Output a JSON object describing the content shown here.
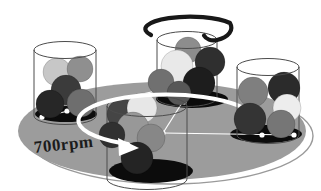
{
  "diagram": {
    "background": "#ffffff"
  },
  "label": {
    "text": "700rpm"
  },
  "colors": {
    "disc": "#9c9c9c",
    "disc_edge_line": "#9a9a9a",
    "shadow": "#0c0c0c",
    "jar_outline": "#4c4c4c",
    "linkage": "#ffffff",
    "arrow": "#ffffff",
    "spiral": "#181818",
    "label_text": "#1c1c1c"
  },
  "disc": {
    "cx": 162,
    "cy": 131,
    "rx": 144,
    "ry": 49,
    "edge": {
      "cx": 170,
      "cy": 136,
      "rx": 143,
      "ry": 48
    }
  },
  "jars": [
    {
      "name": "jar-left",
      "x1": 34,
      "x2": 96,
      "top_y": 50,
      "bottom_y": 116,
      "top_ry": 8.5,
      "shadow": {
        "cx": 66,
        "cy": 114,
        "rx": 31,
        "ry": 8
      },
      "balls": [
        {
          "cx": 57,
          "cy": 72,
          "r": 14,
          "fill": "#c7c7c7"
        },
        {
          "cx": 80,
          "cy": 69,
          "r": 13,
          "fill": "#8f8f8f"
        },
        {
          "cx": 66,
          "cy": 90,
          "r": 15,
          "fill": "#3b3b3b"
        },
        {
          "cx": 50,
          "cy": 104,
          "r": 14,
          "fill": "#272727"
        },
        {
          "cx": 81,
          "cy": 103,
          "r": 14,
          "fill": "#6e6e6e"
        }
      ]
    },
    {
      "name": "jar-top",
      "x1": 157,
      "x2": 217,
      "top_y": 40,
      "bottom_y": 98,
      "top_ry": 8.5,
      "shadow": {
        "cx": 192,
        "cy": 99,
        "rx": 36,
        "ry": 9
      },
      "balls": [
        {
          "cx": 188,
          "cy": 50,
          "r": 13,
          "fill": "#8d8d8d"
        },
        {
          "cx": 210,
          "cy": 62,
          "r": 15,
          "fill": "#2f2f2f"
        },
        {
          "cx": 177,
          "cy": 66,
          "r": 16,
          "fill": "#e9e9e9"
        },
        {
          "cx": 161,
          "cy": 82,
          "r": 13,
          "fill": "#707070"
        },
        {
          "cx": 199,
          "cy": 83,
          "r": 16,
          "fill": "#1d1d1d"
        },
        {
          "cx": 179,
          "cy": 93,
          "r": 12,
          "fill": "#575757"
        }
      ]
    },
    {
      "name": "jar-front",
      "x1": 107,
      "x2": 187,
      "top_y": 106,
      "bottom_y": 179,
      "top_ry": 10.5,
      "shadow": {
        "cx": 151,
        "cy": 171,
        "rx": 42,
        "ry": 12
      },
      "balls": [
        {
          "cx": 122,
          "cy": 114,
          "r": 15,
          "fill": "#454545"
        },
        {
          "cx": 142,
          "cy": 108,
          "r": 15,
          "fill": "#e7e7e7"
        },
        {
          "cx": 133,
          "cy": 128,
          "r": 16,
          "fill": "#989898"
        },
        {
          "cx": 151,
          "cy": 138,
          "r": 14,
          "fill": "#878787"
        },
        {
          "cx": 112,
          "cy": 135,
          "r": 13,
          "fill": "#303030"
        },
        {
          "cx": 137,
          "cy": 158,
          "r": 16,
          "fill": "#242424"
        }
      ]
    },
    {
      "name": "jar-right",
      "x1": 237,
      "x2": 299,
      "top_y": 67,
      "bottom_y": 135,
      "top_ry": 8.5,
      "shadow": {
        "cx": 266,
        "cy": 134,
        "rx": 36,
        "ry": 9
      },
      "balls": [
        {
          "cx": 253,
          "cy": 92,
          "r": 15,
          "fill": "#7f7f7f"
        },
        {
          "cx": 284,
          "cy": 88,
          "r": 16,
          "fill": "#2b2b2b"
        },
        {
          "cx": 287,
          "cy": 108,
          "r": 14,
          "fill": "#ededed"
        },
        {
          "cx": 250,
          "cy": 119,
          "r": 16,
          "fill": "#343434"
        },
        {
          "cx": 281,
          "cy": 124,
          "r": 14,
          "fill": "#767676"
        }
      ]
    }
  ],
  "linkage": {
    "line_width": 1.2,
    "dot_r": 2.6,
    "lines": [
      {
        "x1": 42,
        "y1": 117,
        "x2": 160,
        "y2": 90
      },
      {
        "x1": 163,
        "y1": 133,
        "x2": 187,
        "y2": 95
      },
      {
        "x1": 163,
        "y1": 133,
        "x2": 294,
        "y2": 135
      }
    ],
    "dots": [
      {
        "cx": 42,
        "cy": 117
      },
      {
        "cx": 67,
        "cy": 111
      },
      {
        "cx": 163,
        "cy": 133
      },
      {
        "cx": 187,
        "cy": 95
      },
      {
        "cx": 184,
        "cy": 102
      },
      {
        "cx": 262,
        "cy": 135
      },
      {
        "cx": 294,
        "cy": 135
      }
    ]
  },
  "disc_arrow": {
    "path": "M 254 118 A 88 26 0 1 0 128 144",
    "width": 4,
    "head_points": "118,138 139,148 119,156"
  },
  "jar_spin_arrow": {
    "path": "M 151 35 A 40 11 0 1 1 230 23 C 234 30 229 37 217 40 C 211 41.5 206 39 204 35.5",
    "width": 4.2
  }
}
